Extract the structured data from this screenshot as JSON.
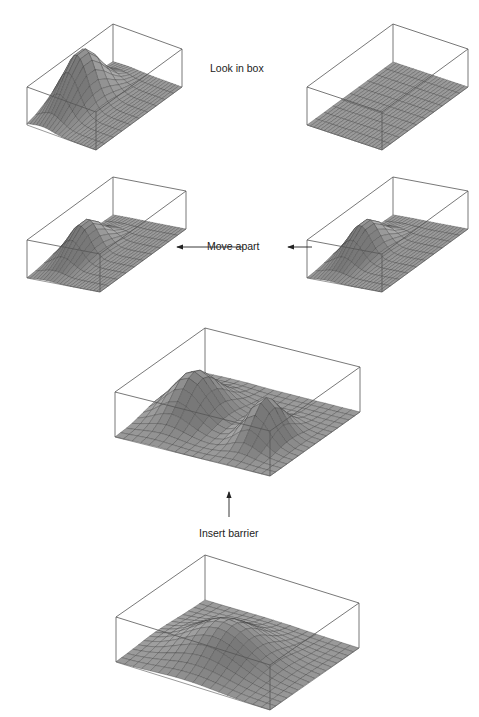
{
  "labels": {
    "look_in_box": "Look in box",
    "move_apart": "Move apart",
    "insert_barrier": "Insert barrier"
  },
  "colors": {
    "box_edge": "#555555",
    "surface_fill": "#9a9a9a",
    "grid_line": "#3a3a3a",
    "text": "#222222"
  },
  "panels": [
    {
      "id": "box-before-look-left",
      "description": "Elongated box with single peaked wavefunction on left end"
    },
    {
      "id": "box-after-look-right",
      "description": "Elongated box with flat (zero) surface"
    },
    {
      "id": "box-moved-left",
      "description": "Elongated box with smaller peak, moved left"
    },
    {
      "id": "box-moved-right",
      "description": "Elongated box with smaller peak, moved right"
    },
    {
      "id": "box-split-two-peaks",
      "description": "Square box with two peaks after barrier inserted"
    },
    {
      "id": "box-initial-single-peak",
      "description": "Square box with single broad peak"
    }
  ]
}
